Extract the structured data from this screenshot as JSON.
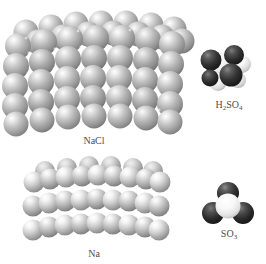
{
  "figure": {
    "top_caption": "which has the fewest",
    "background_color": "#ffffff",
    "panels": [
      {
        "id": "nacl",
        "label": "NaCl",
        "kind": "crystal-lattice",
        "description": "space-filling ionic crystal lattice of sodium chloride",
        "sphere_color": "#b4b4b4",
        "highlight_color": "#ffffff"
      },
      {
        "id": "na",
        "label": "Na",
        "kind": "crystal-lattice",
        "description": "space-filling metallic crystal lattice of sodium",
        "sphere_color": "#c8c8c8",
        "highlight_color": "#ffffff"
      },
      {
        "id": "h2so4",
        "label": "H2SO4",
        "label_parts": [
          {
            "text": "H",
            "sub": false
          },
          {
            "text": "2",
            "sub": true
          },
          {
            "text": "SO",
            "sub": false
          },
          {
            "text": "4",
            "sub": true
          }
        ],
        "kind": "molecule",
        "description": "space-filling model of sulfuric acid",
        "dark_atom_color": "#2e2e2e",
        "light_atom_color": "#f2f2f2"
      },
      {
        "id": "so3",
        "label": "SO3",
        "label_parts": [
          {
            "text": "SO",
            "sub": false
          },
          {
            "text": "3",
            "sub": true
          }
        ],
        "kind": "molecule",
        "description": "space-filling trigonal planar model of sulfur trioxide",
        "dark_atom_color": "#2e2e2e",
        "light_atom_color": "#f4f4f4"
      }
    ]
  }
}
